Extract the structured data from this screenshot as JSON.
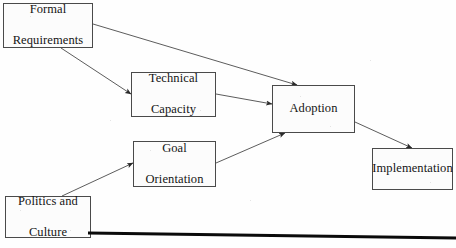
{
  "diagram": {
    "type": "flow-diagram",
    "title": "",
    "background_color": "#fefefe",
    "box_border_color": "#4a4a4a",
    "box_fill_color": "#fcfcfc",
    "edge_color": "#4a4a4a",
    "baseline_color": "#0a0a0a",
    "nodes": [
      {
        "id": "formal-requirements",
        "label": "Formal\nRequirements",
        "line1": "Formal",
        "line2": "Requirements",
        "x": 3,
        "y": 3,
        "w": 90,
        "h": 45
      },
      {
        "id": "technical-capacity",
        "label": "Technical\nCapacity",
        "line1": "Technical",
        "line2": "Capacity",
        "x": 131,
        "y": 72,
        "w": 85,
        "h": 45
      },
      {
        "id": "adoption",
        "label": "Adoption",
        "line1": "Adoption",
        "line2": "",
        "x": 272,
        "y": 85,
        "w": 83,
        "h": 48
      },
      {
        "id": "goal-orientation",
        "label": "Goal\nOrientation",
        "line1": "Goal",
        "line2": "Orientation",
        "x": 133,
        "y": 141,
        "w": 83,
        "h": 46
      },
      {
        "id": "implementation",
        "label": "Implementation",
        "line1": "Implementation",
        "line2": "",
        "x": 372,
        "y": 148,
        "w": 81,
        "h": 42
      },
      {
        "id": "politics-and-culture",
        "label": "Politics and\nCulture",
        "line1": "Politics and",
        "line2": "Culture",
        "x": 5,
        "y": 196,
        "w": 86,
        "h": 42
      }
    ],
    "edges": [
      {
        "id": "formal-requirements-to-adoption",
        "from": "formal-requirements",
        "to": "adoption",
        "from_point": [
          93,
          24
        ],
        "to_point": [
          297,
          85
        ]
      },
      {
        "id": "formal-requirements-to-technical-capacity",
        "from": "formal-requirements",
        "to": "technical-capacity",
        "from_point": [
          61,
          48
        ],
        "to_point": [
          131,
          94
        ]
      },
      {
        "id": "technical-capacity-to-adoption",
        "from": "technical-capacity",
        "to": "adoption",
        "from_point": [
          216,
          94
        ],
        "to_point": [
          272,
          104
        ]
      },
      {
        "id": "goal-orientation-to-adoption",
        "from": "goal-orientation",
        "to": "adoption",
        "from_point": [
          216,
          163
        ],
        "to_point": [
          285,
          133
        ]
      },
      {
        "id": "politics-and-culture-to-goal-orientation",
        "from": "politics-and-culture",
        "to": "goal-orientation",
        "from_point": [
          62,
          196
        ],
        "to_point": [
          133,
          163
        ]
      },
      {
        "id": "adoption-to-implementation",
        "from": "adoption",
        "to": "implementation",
        "from_point": [
          355,
          122
        ],
        "to_point": [
          412,
          148
        ]
      }
    ],
    "baseline": {
      "id": "page-baseline-rule",
      "x1": 88,
      "y1": 233,
      "x2": 456,
      "y2": 238,
      "thickness": 3
    }
  }
}
